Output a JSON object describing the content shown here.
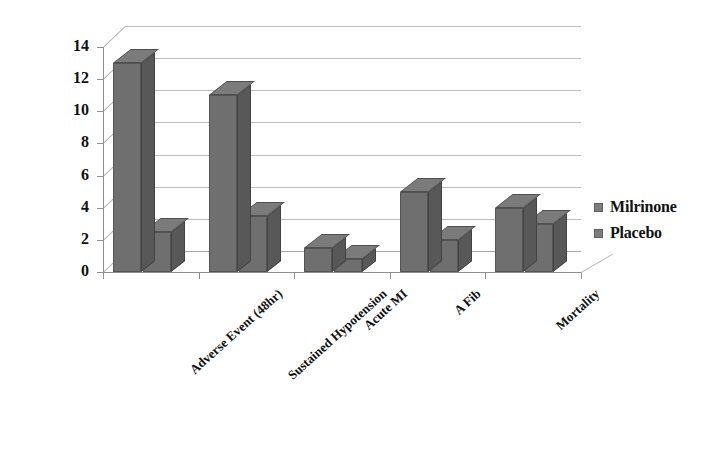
{
  "chart_data": {
    "type": "bar",
    "title": "",
    "subtitle": "",
    "xlabel": "",
    "ylabel": "",
    "ylim": [
      0,
      14
    ],
    "ytick_step": 2,
    "yticks": [
      "0",
      "2",
      "4",
      "6",
      "8",
      "10",
      "12",
      "14"
    ],
    "grid": true,
    "legend_position": "right",
    "style": "3d-grouped-bar",
    "categories": [
      "Adverse Event (48hr)",
      "Sustained Hypotension",
      "Acute MI",
      "A Fib",
      "Mortality"
    ],
    "series": [
      {
        "name": "Milrinone",
        "values": [
          13,
          11,
          1.5,
          5,
          4
        ],
        "color": "#6f6f6f"
      },
      {
        "name": "Placebo",
        "values": [
          2.5,
          3.5,
          0.8,
          2,
          3
        ],
        "color": "#6f6f6f"
      }
    ]
  },
  "legend": {
    "items": [
      {
        "label": "Milrinone"
      },
      {
        "label": "Placebo"
      }
    ]
  },
  "axis": {
    "y_labels": [
      "14",
      "12",
      "10",
      "8",
      "6",
      "4",
      "2",
      "0"
    ]
  },
  "colors": {
    "bar_face": "#6f6f6f",
    "bar_side": "#585858",
    "bar_top": "#7b7b7b",
    "gridline": "#a9a9a9",
    "axis": "#8f8f8f",
    "text": "#111111",
    "background": "#ffffff"
  }
}
